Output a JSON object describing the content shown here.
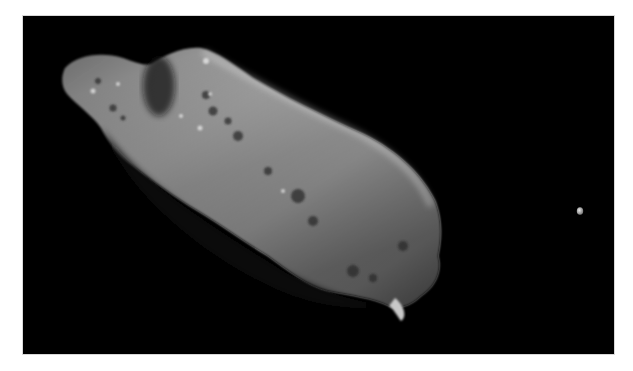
{
  "image": {
    "subject": "asteroid with small moon",
    "background_color": "#000000",
    "frame_color": "#ffffff",
    "asteroid_highlight": "#e6e6e6",
    "asteroid_shadow": "#1a1a1a",
    "moon_color": "#cfcfcf"
  }
}
